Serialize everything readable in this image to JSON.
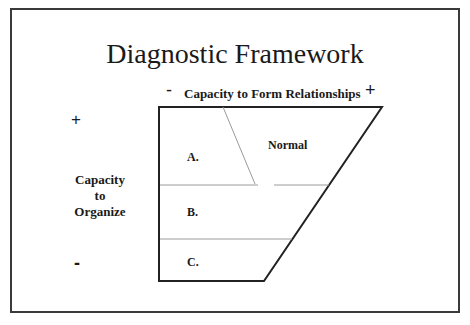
{
  "title": "Diagnostic Framework",
  "x_axis": {
    "label": "Capacity to Form Relationships",
    "minus": "-",
    "plus": "+"
  },
  "y_axis": {
    "label_line1": "Capacity",
    "label_line2": "to",
    "label_line3": "Organize",
    "plus": "+",
    "minus": "-"
  },
  "regions": {
    "a": "A.",
    "b": "B.",
    "c": "C.",
    "normal": "Normal"
  },
  "colors": {
    "outline": "#222222",
    "divider": "#9a9a9a",
    "frame": "#3a3a3a"
  }
}
